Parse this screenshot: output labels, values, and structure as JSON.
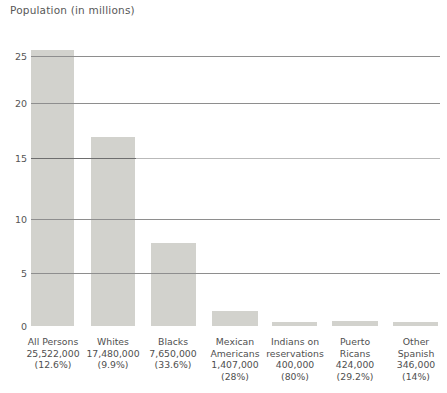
{
  "chart_data": {
    "type": "bar",
    "title": "Population (in millions)",
    "xlabel": "",
    "ylabel": "Population (in millions)",
    "ylim": [
      0,
      27.5
    ],
    "yticks": [
      0,
      5,
      10,
      15,
      20,
      25
    ],
    "ytick_labels": [
      "0",
      "5",
      "10",
      "15",
      "20",
      "25"
    ],
    "grid": true,
    "legend": "none",
    "categories": [
      "All Persons",
      "Whites",
      "Blacks",
      "Mexican Americans",
      "Indians on reservations",
      "Puerto Ricans",
      "Other Spanish"
    ],
    "values": [
      25.522,
      17.48,
      7.65,
      1.407,
      0.4,
      0.424,
      0.346
    ],
    "bars": [
      {
        "name_lines": [
          "All Persons"
        ],
        "count": "25,522,000",
        "percent": "(12.6%)",
        "value": 25.522
      },
      {
        "name_lines": [
          "Whites"
        ],
        "count": "17,480,000",
        "percent": "(9.9%)",
        "value": 17.48
      },
      {
        "name_lines": [
          "Blacks"
        ],
        "count": "7,650,000",
        "percent": "(33.6%)",
        "value": 7.65
      },
      {
        "name_lines": [
          "Mexican",
          "Americans"
        ],
        "count": "1,407,000",
        "percent": "(28%)",
        "value": 1.407
      },
      {
        "name_lines": [
          "Indians on",
          "reservations"
        ],
        "count": "400,000",
        "percent": "(80%)",
        "value": 0.4
      },
      {
        "name_lines": [
          "Puerto",
          "Ricans"
        ],
        "count": "424,000",
        "percent": "(29.2%)",
        "value": 0.424
      },
      {
        "name_lines": [
          "Other",
          "Spanish"
        ],
        "count": "346,000",
        "percent": "(14%)",
        "value": 0.346
      }
    ],
    "colors": {
      "bar_fill": "#d2d2cd",
      "gridline": "#8e8e8e",
      "gridline_faint": "#b9b9b9",
      "text": "#4f4f4f",
      "background": "#ffffff"
    }
  },
  "axis": {
    "tick_25": "25",
    "tick_20": "20",
    "tick_15": "15",
    "tick_10": "10",
    "tick_5": "5",
    "tick_0": "0"
  },
  "labels": {
    "b0_name0": "All Persons",
    "b0_count": "25,522,000",
    "b0_pct": "(12.6%)",
    "b1_name0": "Whites",
    "b1_count": "17,480,000",
    "b1_pct": "(9.9%)",
    "b2_name0": "Blacks",
    "b2_count": "7,650,000",
    "b2_pct": "(33.6%)",
    "b3_name0": "Mexican",
    "b3_name1": "Americans",
    "b3_count": "1,407,000",
    "b3_pct": "(28%)",
    "b4_name0": "Indians on",
    "b4_name1": "reservations",
    "b4_count": "400,000",
    "b4_pct": "(80%)",
    "b5_name0": "Puerto",
    "b5_name1": "Ricans",
    "b5_count": "424,000",
    "b5_pct": "(29.2%)",
    "b6_name0": "Other",
    "b6_name1": "Spanish",
    "b6_count": "346,000",
    "b6_pct": "(14%)"
  },
  "title": {
    "text": "Population (in millions)"
  }
}
